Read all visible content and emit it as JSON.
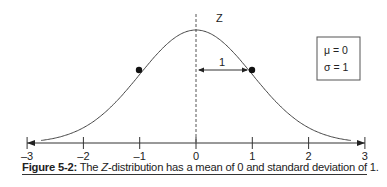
{
  "chart_data": {
    "type": "line",
    "title": "",
    "subtitle": "",
    "xlabel": "",
    "ylabel": "",
    "x_ticks": [
      "-3",
      "-2",
      "-1",
      "0",
      "1",
      "2",
      "3"
    ],
    "xlim": [
      -3,
      3
    ],
    "grid": false,
    "series": [
      {
        "name": "Standard normal density",
        "function": "normal_pdf",
        "mu": 0,
        "sigma": 1
      }
    ],
    "points": [
      {
        "x": -1,
        "label": "inflection"
      },
      {
        "x": 1,
        "label": "inflection"
      }
    ],
    "annotations": {
      "center_line_label": "Z",
      "distance_label": "1",
      "params_box": [
        "μ = 0",
        "σ = 1"
      ]
    },
    "legend": "none"
  },
  "caption": {
    "figure_label": "Figure 5-2:",
    "text_before": " The ",
    "italic": "Z",
    "text_after": "-distribution has a mean of 0 and standard deviation of 1."
  },
  "colors": {
    "line": "#444444",
    "text": "#222222"
  }
}
